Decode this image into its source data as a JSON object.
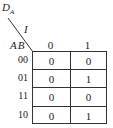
{
  "kmap": {
    "output_label": "D",
    "output_subscript": "A",
    "column_variable": "I",
    "row_variables": "AB",
    "column_headers": [
      "0",
      "1"
    ],
    "row_headers": [
      "00",
      "01",
      "11",
      "10"
    ],
    "cells": [
      [
        "0",
        "0"
      ],
      [
        "0",
        "1"
      ],
      [
        "0",
        "0"
      ],
      [
        "0",
        "1"
      ]
    ]
  }
}
